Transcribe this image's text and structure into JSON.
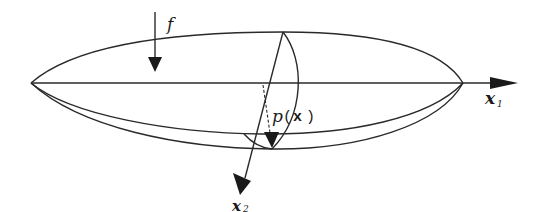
{
  "diagram": {
    "type": "ellipsoid-deformation-sketch",
    "colors": {
      "stroke": "#2a2a2a",
      "background": "#ffffff"
    },
    "labels": {
      "force": "f",
      "pressure_prefix": "p",
      "pressure_open": "(",
      "pressure_var": "x",
      "pressure_close": ")",
      "axis1_base": "x",
      "axis1_sub": "1",
      "axis2_base": "x",
      "axis2_sub": "2"
    },
    "elements": {
      "force_arrow": "force-arrow-f",
      "axis_x1": "horizontal-axis-x1",
      "axis_x2": "oblique-axis-x2",
      "pressure_arrow": "dashed-pressure-arrow",
      "outer_shell": "upper-ellipse-arc",
      "lower_curves": [
        "inner-lower-arc",
        "outer-lower-arc"
      ],
      "cross_section": "cross-section-arc"
    }
  }
}
